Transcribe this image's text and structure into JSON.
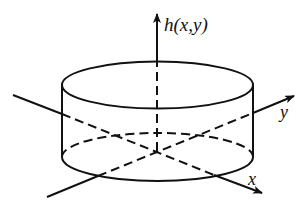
{
  "diagram": {
    "labels": {
      "vertical_axis": "h(x,y)",
      "y_axis": "y",
      "x_axis": "x"
    },
    "colors": {
      "stroke": "#111111",
      "background": "#ffffff"
    },
    "shapes": {
      "cylinder": {
        "top_ellipse": {
          "cx": 157.5,
          "cy": 85,
          "rx": 95.5,
          "ry": 23.5
        },
        "bottom_ellipse": {
          "cx": 157.5,
          "cy": 157,
          "rx": 95.5,
          "ry": 24
        },
        "left_side_x": 62,
        "right_side_x": 253
      },
      "origin": {
        "x": 157,
        "y": 151
      }
    }
  }
}
